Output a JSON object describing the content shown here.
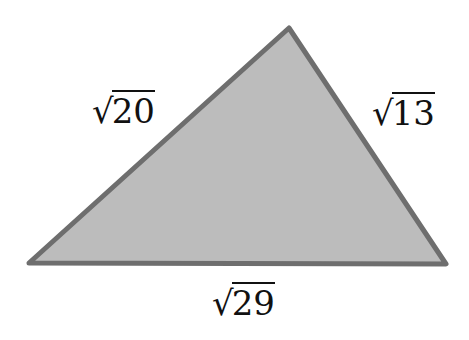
{
  "diagram": {
    "type": "triangle",
    "fill_color": "#bcbcbc",
    "stroke_color": "#6e6e6e",
    "vertices": {
      "left": [
        29,
        263
      ],
      "top": [
        289,
        28
      ],
      "right": [
        446,
        264
      ]
    },
    "sides": {
      "left": {
        "radical": "√",
        "radicand": "20"
      },
      "right": {
        "radical": "√",
        "radicand": "13"
      },
      "bottom": {
        "radical": "√",
        "radicand": "29"
      }
    }
  }
}
